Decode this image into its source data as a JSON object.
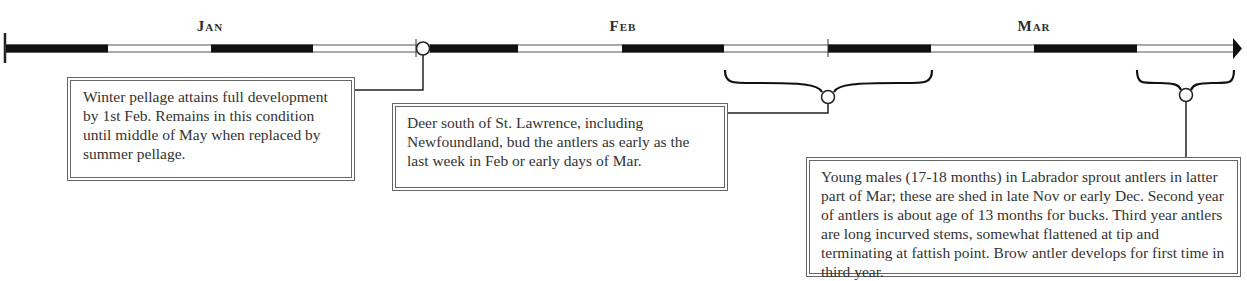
{
  "timeline": {
    "months": [
      {
        "label": "Jan",
        "x": 210
      },
      {
        "label": "Feb",
        "x": 623
      },
      {
        "label": "Mar",
        "x": 1034
      }
    ],
    "start_x": 6,
    "end_x": 1240,
    "y": 48,
    "segment_width": 103,
    "month_boundaries": [
      416,
      828
    ],
    "markers": [
      {
        "type": "circle",
        "x": 423,
        "y": 48
      }
    ],
    "braces": [
      {
        "from_x": 725,
        "to_x": 932,
        "y": 80,
        "node_x": 828,
        "node_y": 97
      },
      {
        "from_x": 1137,
        "to_x": 1234,
        "y": 80,
        "node_x": 1186,
        "node_y": 95
      }
    ],
    "colors": {
      "dark": "#111111",
      "light": "#ffffff",
      "line": "#333333"
    }
  },
  "notes": [
    {
      "id": "winter-pellage",
      "text": "Winter pellage attains full development by 1st Feb. Remains in this condition until middle of May when replaced by summer pellage."
    },
    {
      "id": "deer-south",
      "text": "Deer south of St. Lawrence, including Newfoundland, bud the antlers as early as the last week in Feb or early days of Mar."
    },
    {
      "id": "young-males",
      "text": "Young males (17-18 months) in Labrador sprout antlers in latter part of Mar; these are shed in late Nov or early Dec. Second year of antlers is about age of 13 months for bucks. Third year antlers are long incurved stems, somewhat flattened at tip and terminating at fattish point. Brow antler develops for first time in third year."
    }
  ]
}
